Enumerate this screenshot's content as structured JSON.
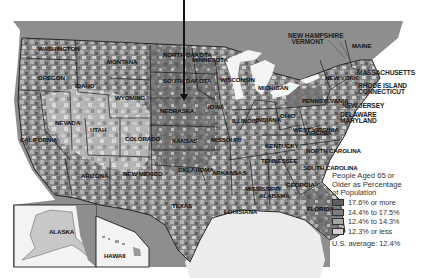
{
  "map": {
    "subject": "People Aged 65 or Older as Percentage of Population by county",
    "region": "United States",
    "colors": {
      "water": "#8e8e8e",
      "land_outside": "#dcdcdc",
      "class_1": "#5e5e5e",
      "class_2": "#7d7d7d",
      "class_3": "#a3a3a3",
      "class_4": "#cfcfcf",
      "border": "#1a1a1a",
      "background": "#ffffff"
    },
    "state_labels": [
      {
        "name": "WASHINGTON",
        "x": 38,
        "y": 46
      },
      {
        "name": "OREGON",
        "x": 38,
        "y": 75
      },
      {
        "name": "CALIFORNIA",
        "x": 20,
        "y": 137
      },
      {
        "name": "NEVADA",
        "x": 55,
        "y": 120
      },
      {
        "name": "IDAHO",
        "x": 75,
        "y": 83
      },
      {
        "name": "MONTANA",
        "x": 107,
        "y": 59
      },
      {
        "name": "WYOMING",
        "x": 115,
        "y": 95
      },
      {
        "name": "UTAH",
        "x": 90,
        "y": 127
      },
      {
        "name": "COLORADO",
        "x": 125,
        "y": 136
      },
      {
        "name": "ARIZONA",
        "x": 81,
        "y": 173
      },
      {
        "name": "NEW MEXICO",
        "x": 123,
        "y": 171
      },
      {
        "name": "NORTH DAKOTA",
        "x": 163,
        "y": 52
      },
      {
        "name": "SOUTH DAKOTA",
        "x": 163,
        "y": 78
      },
      {
        "name": "NEBRASKA",
        "x": 160,
        "y": 108
      },
      {
        "name": "KANSAS",
        "x": 172,
        "y": 138
      },
      {
        "name": "OKLAHOMA",
        "x": 178,
        "y": 167
      },
      {
        "name": "TEXAS",
        "x": 172,
        "y": 203
      },
      {
        "name": "MINNESOTA",
        "x": 192,
        "y": 57
      },
      {
        "name": "IOWA",
        "x": 208,
        "y": 104
      },
      {
        "name": "MISSOURI",
        "x": 211,
        "y": 137
      },
      {
        "name": "ARKANSAS",
        "x": 212,
        "y": 170
      },
      {
        "name": "LOUISIANA",
        "x": 224,
        "y": 209
      },
      {
        "name": "WISCONSIN",
        "x": 220,
        "y": 77
      },
      {
        "name": "ILLINOIS",
        "x": 232,
        "y": 118
      },
      {
        "name": "MICHIGAN",
        "x": 258,
        "y": 85
      },
      {
        "name": "INDIANA",
        "x": 256,
        "y": 117
      },
      {
        "name": "OHIO",
        "x": 280,
        "y": 113
      },
      {
        "name": "KENTUCKY",
        "x": 265,
        "y": 143
      },
      {
        "name": "TENNESSEE",
        "x": 261,
        "y": 158
      },
      {
        "name": "MISSISSIPPI",
        "x": 245,
        "y": 186
      },
      {
        "name": "ALABAMA",
        "x": 259,
        "y": 193
      },
      {
        "name": "GEORGIA",
        "x": 286,
        "y": 182
      },
      {
        "name": "FLORIDA",
        "x": 307,
        "y": 206
      },
      {
        "name": "SOUTH CAROLINA",
        "x": 303,
        "y": 165
      },
      {
        "name": "NORTH CAROLINA",
        "x": 306,
        "y": 148
      },
      {
        "name": "VIRGINIA",
        "x": 305,
        "y": 130
      },
      {
        "name": "WEST VIRGINIA",
        "x": 293,
        "y": 127
      },
      {
        "name": "PENNSYLVANIA",
        "x": 302,
        "y": 98
      },
      {
        "name": "NEW YORK",
        "x": 325,
        "y": 75
      },
      {
        "name": "MAINE",
        "x": 352,
        "y": 43
      }
    ],
    "outside_labels": [
      {
        "name": "NEW HAMPSHIRE\n  VERMONT",
        "x": 288,
        "y": 33
      },
      {
        "name": "MASSACHUSETTS",
        "x": 357,
        "y": 70
      },
      {
        "name": "RHODE ISLAND\nCONNECTICUT",
        "x": 358,
        "y": 83
      },
      {
        "name": "NEW JERSEY",
        "x": 342,
        "y": 103
      },
      {
        "name": "DELAWARE\nMARYLAND",
        "x": 340,
        "y": 112
      }
    ],
    "insets": [
      {
        "name": "ALASKA",
        "x": 49,
        "y": 229
      },
      {
        "name": "HAWAII",
        "x": 104,
        "y": 253
      }
    ],
    "pointer_arrow": {
      "x": 183,
      "y_start": 0,
      "y_end": 100,
      "target": "NEBRASKA"
    }
  },
  "legend": {
    "title": "People Aged 65 or\nOlder as Percentage\nof Population",
    "classes": [
      {
        "label": "17.6% or more",
        "color": "#5e5e5e"
      },
      {
        "label": "14.4% to 17.5%",
        "color": "#7d7d7d"
      },
      {
        "label": "12.4% to 14.3%",
        "color": "#a3a3a3"
      },
      {
        "label": "12.3% or less",
        "color": "#d2d2d2"
      }
    ],
    "average": "U.S. average: 12.4%"
  }
}
